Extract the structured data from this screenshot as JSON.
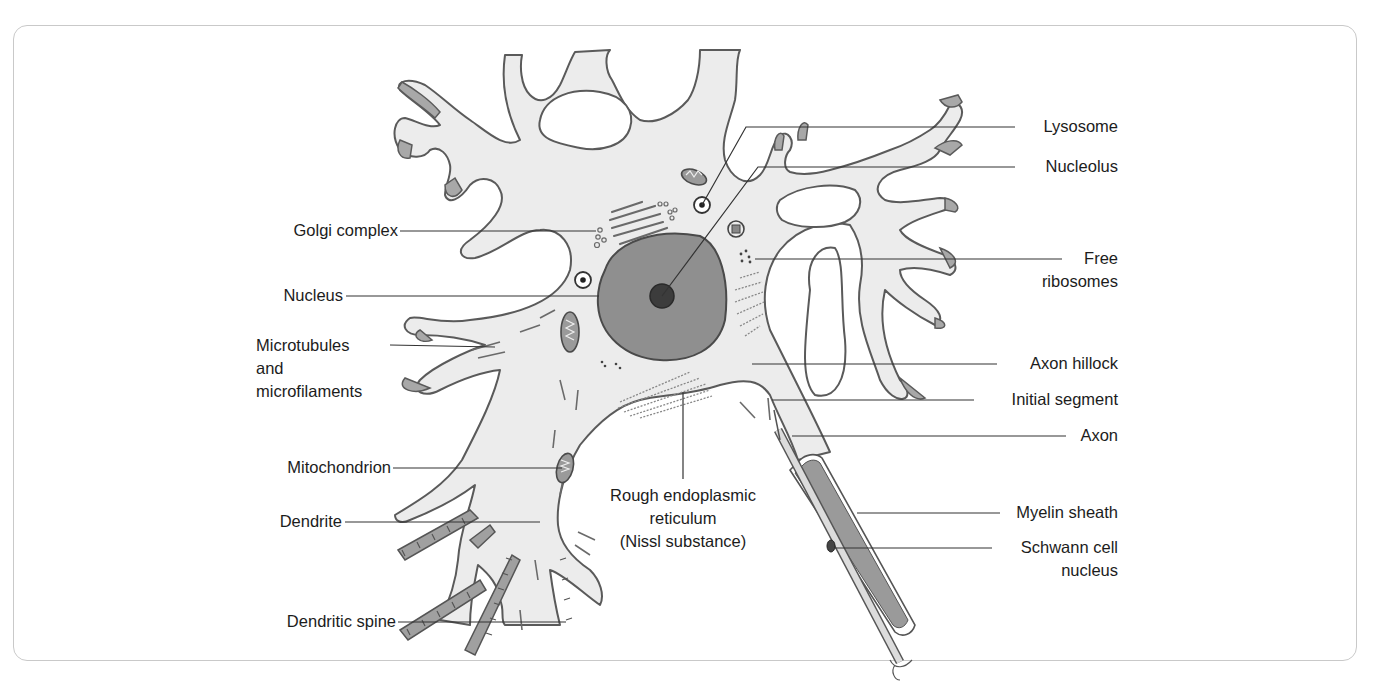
{
  "diagram": {
    "labels_left": [
      {
        "id": "golgi",
        "text": "Golgi complex"
      },
      {
        "id": "nucleus",
        "text": "Nucleus"
      },
      {
        "id": "microtubules",
        "lines": [
          "Microtubules",
          "and",
          "microfilaments"
        ]
      },
      {
        "id": "mitochondrion",
        "text": "Mitochondrion"
      },
      {
        "id": "dendrite",
        "text": "Dendrite"
      },
      {
        "id": "dendritic_spine",
        "text": "Dendritic spine"
      }
    ],
    "labels_right": [
      {
        "id": "lysosome",
        "text": "Lysosome"
      },
      {
        "id": "nucleolus",
        "text": "Nucleolus"
      },
      {
        "id": "free_ribosomes",
        "lines": [
          "Free",
          "ribosomes"
        ]
      },
      {
        "id": "axon_hillock",
        "text": "Axon hillock"
      },
      {
        "id": "initial_segment",
        "text": "Initial segment"
      },
      {
        "id": "axon",
        "text": "Axon"
      },
      {
        "id": "myelin_sheath",
        "text": "Myelin sheath"
      },
      {
        "id": "schwann_nucleus",
        "lines": [
          "Schwann cell",
          "nucleus"
        ]
      }
    ],
    "labels_center": [
      {
        "id": "rough_er",
        "lines": [
          "Rough endoplasmic",
          "reticulum",
          "(Nissl substance)"
        ]
      }
    ],
    "colors": {
      "cell_fill": "#ececec",
      "cell_outline": "#5a5a5a",
      "dendrite_tip": "#a8a8a8",
      "nucleus_fill": "#8f8f8f",
      "nucleolus_fill": "#3c3c3c",
      "myelin_fill": "#9a9a9a",
      "leader_line": "#333333",
      "frame_border": "#c9c9c9"
    }
  }
}
